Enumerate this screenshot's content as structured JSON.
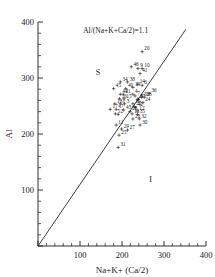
{
  "chart_data": {
    "type": "scatter",
    "title": "",
    "xlabel": "Na+K+ (Ca/2)",
    "ylabel": "Al",
    "xlim": [
      0,
      400
    ],
    "ylim": [
      0,
      400
    ],
    "x_ticks": [
      0,
      100,
      200,
      300,
      400
    ],
    "x_tick_labels": [
      "",
      "100",
      "200",
      "300",
      "400"
    ],
    "y_ticks": [
      0,
      100,
      200,
      300,
      400
    ],
    "y_tick_labels": [
      "",
      "100",
      "200",
      "300",
      "400"
    ],
    "x_minor_interval": 20,
    "y_minor_interval": 20,
    "grid": false,
    "legend": "none",
    "annotations": [
      {
        "text": "Al/(Na+K+Ca/2)=1.1",
        "x": 185,
        "y": 380
      },
      {
        "text": "S",
        "x": 143,
        "y": 305
      },
      {
        "text": "I",
        "x": 268,
        "y": 115
      }
    ],
    "reference_line": {
      "label": "Al/(Na+K+Ca/2)=1.1",
      "slope": 1.1,
      "intercept": 0,
      "x_start": 0,
      "y_start": 0,
      "x_end": 352,
      "y_end": 387
    },
    "marker_style": "plus",
    "points": [
      {
        "label": "1",
        "x": 196,
        "y": 254
      },
      {
        "label": "2",
        "x": 191,
        "y": 235
      },
      {
        "label": "3",
        "x": 206,
        "y": 254
      },
      {
        "label": "4",
        "x": 226,
        "y": 271
      },
      {
        "label": "5",
        "x": 184,
        "y": 236
      },
      {
        "label": "6",
        "x": 248,
        "y": 287
      },
      {
        "label": "7",
        "x": 231,
        "y": 268
      },
      {
        "label": "8",
        "x": 238,
        "y": 262
      },
      {
        "label": "9",
        "x": 238,
        "y": 317
      },
      {
        "label": "10",
        "x": 248,
        "y": 317
      },
      {
        "label": "11",
        "x": 186,
        "y": 216
      },
      {
        "label": "12",
        "x": 236,
        "y": 241
      },
      {
        "label": "13",
        "x": 224,
        "y": 236
      },
      {
        "label": "14",
        "x": 237,
        "y": 289
      },
      {
        "label": "15",
        "x": 205,
        "y": 263
      },
      {
        "label": "16",
        "x": 194,
        "y": 263
      },
      {
        "label": "17",
        "x": 172,
        "y": 244
      },
      {
        "label": "18",
        "x": 183,
        "y": 254
      },
      {
        "label": "19",
        "x": 226,
        "y": 283
      },
      {
        "label": "20",
        "x": 248,
        "y": 347
      },
      {
        "label": "21",
        "x": 203,
        "y": 271
      },
      {
        "label": "22",
        "x": 229,
        "y": 249
      },
      {
        "label": "23",
        "x": 253,
        "y": 266
      },
      {
        "label": "24",
        "x": 250,
        "y": 256
      },
      {
        "label": "25",
        "x": 193,
        "y": 198
      },
      {
        "label": "26",
        "x": 226,
        "y": 227
      },
      {
        "label": "27",
        "x": 213,
        "y": 207
      },
      {
        "label": "28",
        "x": 219,
        "y": 240
      },
      {
        "label": "29",
        "x": 199,
        "y": 209
      },
      {
        "label": "30",
        "x": 243,
        "y": 216
      },
      {
        "label": "31",
        "x": 191,
        "y": 176
      },
      {
        "label": "32",
        "x": 241,
        "y": 227
      },
      {
        "label": "33",
        "x": 247,
        "y": 266
      },
      {
        "label": "34",
        "x": 196,
        "y": 293
      },
      {
        "label": "35",
        "x": 237,
        "y": 235
      },
      {
        "label": "36",
        "x": 265,
        "y": 272
      },
      {
        "label": "37",
        "x": 238,
        "y": 262
      },
      {
        "label": "38",
        "x": 213,
        "y": 293
      },
      {
        "label": "39",
        "x": 226,
        "y": 254
      },
      {
        "label": "40",
        "x": 209,
        "y": 281
      },
      {
        "label": "41",
        "x": 243,
        "y": 308
      },
      {
        "label": "42",
        "x": 232,
        "y": 247
      },
      {
        "label": "43",
        "x": 204,
        "y": 243
      },
      {
        "label": "44",
        "x": 196,
        "y": 271
      },
      {
        "label": "45",
        "x": 180,
        "y": 281
      },
      {
        "label": "46",
        "x": 222,
        "y": 320
      },
      {
        "label": "47",
        "x": 186,
        "y": 244
      }
    ]
  }
}
